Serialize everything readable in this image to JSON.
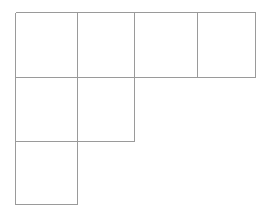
{
  "figure": {
    "background_color": "#ffffff",
    "line_color": "#9a9a9a",
    "line_width": 1,
    "canvas": {
      "width": 273,
      "height": 220
    },
    "grid": {
      "origin_x": 15,
      "origin_y": 12,
      "cell_width": 60.5,
      "cell_height": 64,
      "columns": 4,
      "rows": 3,
      "column_edges": [
        15,
        77,
        134,
        197,
        255
      ],
      "row_edges": [
        12,
        77,
        141,
        204
      ]
    },
    "cells": [
      {
        "name": "cell-r1-c1",
        "row": 1,
        "col": 1,
        "x": 15,
        "y": 12,
        "w": 62,
        "h": 65
      },
      {
        "name": "cell-r1-c2",
        "row": 1,
        "col": 2,
        "x": 77,
        "y": 12,
        "w": 57,
        "h": 65
      },
      {
        "name": "cell-r1-c3",
        "row": 1,
        "col": 3,
        "x": 134,
        "y": 12,
        "w": 63,
        "h": 65
      },
      {
        "name": "cell-r1-c4",
        "row": 1,
        "col": 4,
        "x": 197,
        "y": 12,
        "w": 58,
        "h": 65
      },
      {
        "name": "cell-r2-c1",
        "row": 2,
        "col": 1,
        "x": 15,
        "y": 77,
        "w": 62,
        "h": 64
      },
      {
        "name": "cell-r2-c2",
        "row": 2,
        "col": 2,
        "x": 77,
        "y": 77,
        "w": 57,
        "h": 64
      },
      {
        "name": "cell-r3-c1",
        "row": 3,
        "col": 1,
        "x": 15,
        "y": 141,
        "w": 62,
        "h": 63
      }
    ],
    "cell_count": 7,
    "row_cell_counts": [
      4,
      2,
      1
    ],
    "segments": [
      {
        "name": "outer-top-edge",
        "orientation": "horizontal",
        "x1": 15,
        "y1": 12,
        "x2": 255,
        "y2": 12
      },
      {
        "name": "row1-row2-divider",
        "orientation": "horizontal",
        "x1": 15,
        "y1": 77,
        "x2": 255,
        "y2": 77
      },
      {
        "name": "row2-row3-divider",
        "orientation": "horizontal",
        "x1": 15,
        "y1": 141,
        "x2": 134,
        "y2": 141
      },
      {
        "name": "outer-bottom-edge",
        "orientation": "horizontal",
        "x1": 15,
        "y1": 204,
        "x2": 77,
        "y2": 204
      },
      {
        "name": "outer-left-edge",
        "orientation": "vertical",
        "x1": 15,
        "y1": 12,
        "x2": 15,
        "y2": 204
      },
      {
        "name": "col1-col2-divider",
        "orientation": "vertical",
        "x1": 77,
        "y1": 12,
        "x2": 77,
        "y2": 204
      },
      {
        "name": "col2-col3-divider",
        "orientation": "vertical",
        "x1": 134,
        "y1": 12,
        "x2": 134,
        "y2": 141
      },
      {
        "name": "col3-col4-divider",
        "orientation": "vertical",
        "x1": 197,
        "y1": 12,
        "x2": 197,
        "y2": 77
      },
      {
        "name": "outer-right-edge",
        "orientation": "vertical",
        "x1": 255,
        "y1": 12,
        "x2": 255,
        "y2": 77
      }
    ]
  }
}
